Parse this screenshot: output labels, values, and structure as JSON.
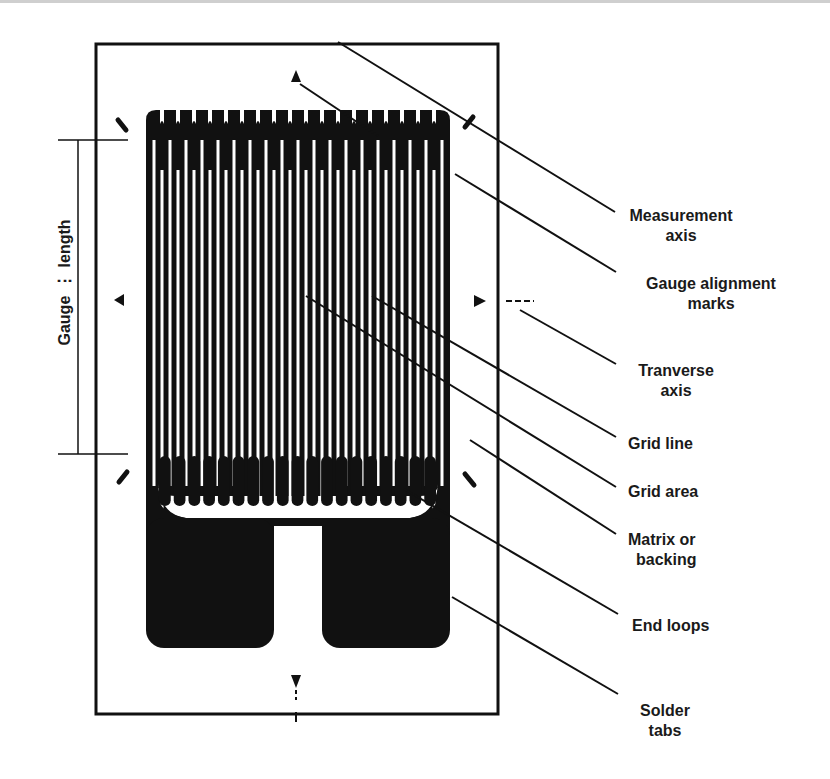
{
  "figure": {
    "gauge_length_label": [
      "Gauge",
      "length"
    ],
    "grid_loop_count": 19,
    "colors": {
      "ink": "#111111",
      "paper": "#ffffff"
    }
  },
  "labels": [
    {
      "id": "measurement-axis",
      "lines": [
        "Measurement",
        "axis"
      ]
    },
    {
      "id": "gauge-alignment-marks",
      "lines": [
        "Gauge alignment",
        "marks"
      ]
    },
    {
      "id": "transverse-axis",
      "lines": [
        "Tranverse",
        "axis"
      ]
    },
    {
      "id": "grid-line",
      "lines": [
        "Grid line"
      ]
    },
    {
      "id": "grid-area",
      "lines": [
        "Grid area"
      ]
    },
    {
      "id": "matrix-or-backing",
      "lines": [
        "Matrix or",
        "backing"
      ]
    },
    {
      "id": "end-loops",
      "lines": [
        "End loops"
      ]
    },
    {
      "id": "solder-tabs",
      "lines": [
        "Solder",
        "tabs"
      ]
    }
  ]
}
